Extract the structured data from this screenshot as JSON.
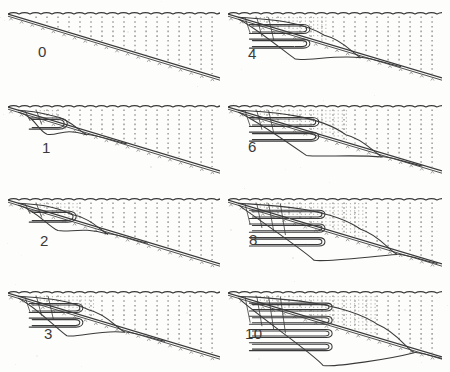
{
  "figure": {
    "type": "multi-panel-contour-sequence",
    "panel_count": 8,
    "columns": 2,
    "rows": 4,
    "width": 450,
    "height": 372,
    "background_color": "#fdfdfc",
    "line_color": "#3a3a3a",
    "grid_color": "#9a9a96",
    "label_color": "#3a3a3a"
  },
  "panels": [
    {
      "label": "0",
      "label_x": 38,
      "label_y": 44,
      "col": 0,
      "row": 0,
      "x": 8,
      "y": 4,
      "w": 212,
      "h": 84,
      "slope_start_y": 10,
      "slope_end_y": 74,
      "lobes": 0,
      "lobe_rows": 0,
      "front_x": 0.06,
      "description": "initial state, no disturbance"
    },
    {
      "label": "1",
      "label_x": 42,
      "label_y": 140,
      "col": 0,
      "row": 1,
      "x": 8,
      "y": 97,
      "w": 212,
      "h": 84,
      "slope_start_y": 10,
      "slope_end_y": 74,
      "lobes": 2,
      "lobe_rows": 1,
      "front_x": 0.2,
      "description": "small box-like perturbation near upslope"
    },
    {
      "label": "2",
      "label_x": 40,
      "label_y": 233,
      "col": 0,
      "row": 2,
      "x": 8,
      "y": 190,
      "w": 212,
      "h": 84,
      "slope_start_y": 10,
      "slope_end_y": 74,
      "lobes": 3,
      "lobe_rows": 1,
      "front_x": 0.3,
      "description": "triangular wedge detaching from slope"
    },
    {
      "label": "3",
      "label_x": 44,
      "label_y": 326,
      "col": 0,
      "row": 3,
      "x": 8,
      "y": 283,
      "w": 212,
      "h": 85,
      "slope_start_y": 10,
      "slope_end_y": 74,
      "lobes": 4,
      "lobe_rows": 2,
      "front_x": 0.38,
      "description": "wedge deepening, front moves downslope"
    },
    {
      "label": "4",
      "label_x": 248,
      "label_y": 46,
      "col": 1,
      "row": 0,
      "x": 228,
      "y": 4,
      "w": 214,
      "h": 84,
      "slope_start_y": 10,
      "slope_end_y": 74,
      "lobes": 4,
      "lobe_rows": 2,
      "front_x": 0.45,
      "description": "closed eddy core forms mid-slope"
    },
    {
      "label": "6",
      "label_x": 248,
      "label_y": 139,
      "col": 1,
      "row": 1,
      "x": 228,
      "y": 97,
      "w": 214,
      "h": 84,
      "slope_start_y": 10,
      "slope_end_y": 74,
      "lobes": 6,
      "lobe_rows": 2,
      "front_x": 0.55,
      "description": "two stacked recirculating cells"
    },
    {
      "label": "8",
      "label_x": 249,
      "label_y": 232,
      "col": 1,
      "row": 2,
      "x": 228,
      "y": 190,
      "w": 214,
      "h": 84,
      "slope_start_y": 10,
      "slope_end_y": 74,
      "lobes": 8,
      "lobe_rows": 3,
      "front_x": 0.62,
      "description": "three stacked lobes, deep intrusion"
    },
    {
      "label": "10",
      "label_x": 245,
      "label_y": 326,
      "col": 1,
      "row": 3,
      "x": 228,
      "y": 283,
      "w": 214,
      "h": 85,
      "slope_start_y": 10,
      "slope_end_y": 74,
      "lobes": 10,
      "lobe_rows": 4,
      "front_x": 0.7,
      "description": "four stacked lobes, maximum penetration depth"
    }
  ],
  "chart_data": {
    "type": "line",
    "title": "",
    "xlabel": "",
    "ylabel": "",
    "series": [
      {
        "name": "free-surface",
        "note": "wavy scalloped top boundary, constant"
      },
      {
        "name": "bottom-slope",
        "note": "linear descending boundary left to right"
      },
      {
        "name": "isopycnal-contours",
        "note": "nested lobes, count grows with time index"
      },
      {
        "name": "vertical-grid",
        "note": "dashed columns spanning surface to slope"
      }
    ],
    "categories": [
      "0",
      "1",
      "2",
      "3",
      "4",
      "6",
      "8",
      "10"
    ],
    "values": [
      0,
      2,
      3,
      4,
      4,
      6,
      8,
      10
    ],
    "legend": "none",
    "grid": true
  }
}
